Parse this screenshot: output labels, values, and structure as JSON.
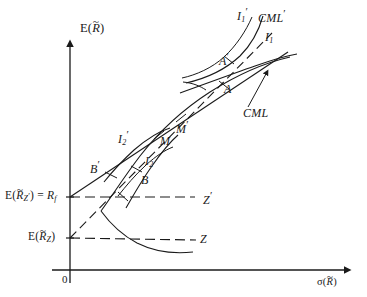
{
  "figure": {
    "type": "diagram",
    "axes": {
      "y_label": {
        "prefix": "E(",
        "var": "R",
        "accent": "~",
        "suffix": ")"
      },
      "x_label": {
        "prefix": "σ(",
        "var": "R",
        "accent": "~",
        "suffix": ")"
      },
      "origin": "0"
    },
    "y_ticks": [
      {
        "id": "rf-level",
        "text_parts": {
          "lead": "E(",
          "var": "R",
          "accent": "~",
          "sub": "Z",
          "sub_prime": "′",
          "mid": ") = ",
          "rhs": "R",
          "rhs_sub": "f"
        },
        "value_name": "risk-free-rate"
      },
      {
        "id": "erz-level",
        "text_parts": {
          "lead": "E(",
          "var": "R",
          "accent": "~",
          "sub": "Z",
          "sub_prime": "",
          "mid": ")",
          "rhs": "",
          "rhs_sub": ""
        },
        "value_name": "zero-beta-expected-return"
      }
    ],
    "point_labels": [
      {
        "name": "I1-prime",
        "base": "I",
        "sub": "1",
        "prime": true
      },
      {
        "name": "CML-prime",
        "base": "CML",
        "sub": "",
        "prime": true
      },
      {
        "name": "I1",
        "base": "I",
        "sub": "1",
        "prime": false
      },
      {
        "name": "A-prime",
        "base": "A",
        "sub": "",
        "prime": true
      },
      {
        "name": "A",
        "base": "A",
        "sub": "",
        "prime": false
      },
      {
        "name": "CML",
        "base": "CML",
        "sub": "",
        "prime": false
      },
      {
        "name": "M-prime",
        "base": "M",
        "sub": "",
        "prime": true
      },
      {
        "name": "M",
        "base": "M",
        "sub": "",
        "prime": false
      },
      {
        "name": "I2-prime",
        "base": "I",
        "sub": "2",
        "prime": true
      },
      {
        "name": "I2",
        "base": "I",
        "sub": "2",
        "prime": false
      },
      {
        "name": "B-prime",
        "base": "B",
        "sub": "",
        "prime": true
      },
      {
        "name": "B",
        "base": "B",
        "sub": "",
        "prime": false
      },
      {
        "name": "Z-prime",
        "base": "Z",
        "sub": "",
        "prime": true
      },
      {
        "name": "Z",
        "base": "Z",
        "sub": "",
        "prime": false
      }
    ],
    "colors": {
      "ink": "#1a1a1a",
      "background": "#ffffff"
    }
  }
}
